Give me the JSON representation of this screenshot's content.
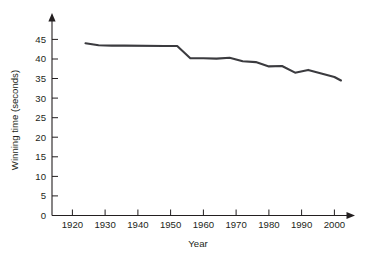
{
  "chart_data": {
    "type": "line",
    "title": "",
    "xlabel": "Year",
    "ylabel": "Winning time (seconds)",
    "xlim": [
      1915,
      2006
    ],
    "ylim": [
      0,
      47
    ],
    "xticks": [
      1920,
      1930,
      1940,
      1950,
      1960,
      1970,
      1980,
      1990,
      2000
    ],
    "yticks": [
      0,
      5,
      10,
      15,
      20,
      25,
      30,
      35,
      40,
      45
    ],
    "grid": false,
    "legend": null,
    "legend_position": "none",
    "axis_style": "arrow-tipped open axes",
    "line_color": "#3b3b3f",
    "series": [
      {
        "name": "Winning time",
        "x": [
          1924,
          1928,
          1932,
          1936,
          1948,
          1952,
          1956,
          1960,
          1964,
          1968,
          1972,
          1976,
          1980,
          1984,
          1988,
          1992,
          1996,
          2000,
          2002
        ],
        "values": [
          44.0,
          43.5,
          43.4,
          43.4,
          43.3,
          43.3,
          40.2,
          40.2,
          40.1,
          40.3,
          39.4,
          39.2,
          38.1,
          38.2,
          36.5,
          37.2,
          36.3,
          35.4,
          34.5
        ]
      }
    ]
  },
  "axis_labels": {
    "x_title": "Year",
    "y_title": "Winning time (seconds)",
    "xticks": [
      "1920",
      "1930",
      "1940",
      "1950",
      "1960",
      "1970",
      "1980",
      "1990",
      "2000"
    ],
    "yticks": [
      "0",
      "5",
      "10",
      "15",
      "20",
      "25",
      "30",
      "35",
      "40",
      "45"
    ]
  }
}
